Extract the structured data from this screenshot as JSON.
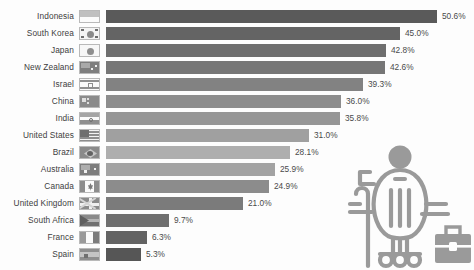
{
  "chart_data": {
    "type": "bar",
    "orientation": "horizontal",
    "title": "",
    "subtitle": "",
    "xlabel": "",
    "ylabel": "",
    "xlim": [
      0,
      50.6
    ],
    "grid": false,
    "legend": false,
    "value_suffix": "%",
    "categories": [
      "Indonesia",
      "South Korea",
      "Japan",
      "New Zealand",
      "Israel",
      "China",
      "India",
      "United States",
      "Brazil",
      "Australia",
      "Canada",
      "United Kingdom",
      "South Africa",
      "France",
      "Spain"
    ],
    "values": [
      50.6,
      45.0,
      42.8,
      42.6,
      39.3,
      36.0,
      35.8,
      31.0,
      28.1,
      25.9,
      24.9,
      21.0,
      9.7,
      6.3,
      5.3
    ],
    "value_labels": [
      "50.6%",
      "45.0%",
      "42.8%",
      "42.6%",
      "39.3%",
      "36.0%",
      "35.8%",
      "31.0%",
      "28.1%",
      "25.9%",
      "24.9%",
      "21.0%",
      "9.7%",
      "6.3%",
      "5.3%"
    ],
    "bar_colors": [
      "#5a5a5a",
      "#646464",
      "#6e6e6e",
      "#767676",
      "#828282",
      "#8d8d8d",
      "#969696",
      "#a0a0a0",
      "#aeaeae",
      "#a3a3a3",
      "#8c8c8c",
      "#7b7b7b",
      "#6f6f6f",
      "#636363",
      "#565656"
    ],
    "flag_names": [
      "flag-indonesia",
      "flag-south-korea",
      "flag-japan",
      "flag-new-zealand",
      "flag-israel",
      "flag-china",
      "flag-india",
      "flag-united-states",
      "flag-brazil",
      "flag-australia",
      "flag-canada",
      "flag-united-kingdom",
      "flag-south-africa",
      "flag-france",
      "flag-spain"
    ]
  },
  "illustration": {
    "name": "person-in-wheelchair-with-briefcase-icon",
    "color": "#9a9a9a"
  },
  "axis": {
    "bar_origin_px": 106,
    "px_per_unit": 6.54
  }
}
